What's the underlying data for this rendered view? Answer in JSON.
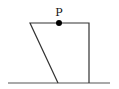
{
  "diagram": {
    "point_label": "P",
    "colors": {
      "stroke": "#333333",
      "point": "#000000",
      "background": "#ffffff"
    },
    "shape": {
      "type": "trapezoid",
      "vertices": [
        [
          30,
          23
        ],
        [
          89,
          23
        ],
        [
          89,
          83
        ],
        [
          58,
          83
        ]
      ]
    },
    "ground": {
      "x1": 8,
      "x2": 110,
      "y": 83
    },
    "point": {
      "x": 59,
      "y": 23,
      "r": 3
    }
  }
}
